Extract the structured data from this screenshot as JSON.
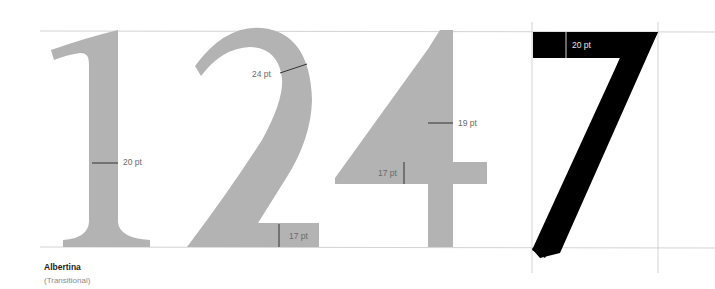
{
  "colors": {
    "glyph_gray": "#b3b3b3",
    "glyph_black": "#000000",
    "guide_line": "#c8c8c8",
    "measure_line": "#333333",
    "label_text": "#6a6a6a"
  },
  "glyphs": [
    {
      "char": "1",
      "color": "gray"
    },
    {
      "char": "2",
      "color": "gray"
    },
    {
      "char": "4",
      "color": "gray"
    },
    {
      "char": "7",
      "color": "black"
    }
  ],
  "measurements": {
    "one_stem": "20 pt",
    "two_bowl": "24 pt",
    "two_base": "17 pt",
    "four_stem": "19 pt",
    "four_crossbar": "17 pt",
    "seven_top": "20 pt"
  },
  "caption": {
    "typeface": "Albertina",
    "classification": "(Transitional)"
  }
}
